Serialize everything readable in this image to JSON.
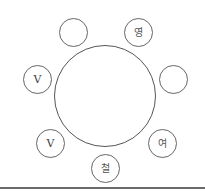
{
  "diagram": {
    "type": "round-table-seating",
    "table": {
      "label": ""
    },
    "seats": [
      {
        "position": "top-left",
        "label": "",
        "cx": 73,
        "cy": 32
      },
      {
        "position": "top-right",
        "label": "영",
        "cx": 138,
        "cy": 32
      },
      {
        "position": "left",
        "label": "V",
        "cx": 37,
        "cy": 79
      },
      {
        "position": "right",
        "label": "",
        "cx": 173,
        "cy": 79
      },
      {
        "position": "bottom-left",
        "label": "V",
        "cx": 50,
        "cy": 143
      },
      {
        "position": "bottom-right",
        "label": "여",
        "cx": 162,
        "cy": 143
      },
      {
        "position": "bottom",
        "label": "철",
        "cx": 105,
        "cy": 168
      }
    ]
  },
  "colors": {
    "stroke": "#555555",
    "text": "#444444",
    "baseline": "#6a6a6a",
    "background": "#ffffff"
  }
}
